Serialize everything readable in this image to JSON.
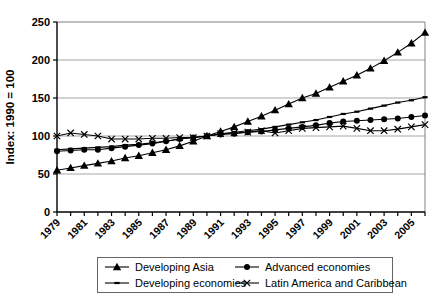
{
  "chart_data": {
    "type": "line",
    "title": "",
    "xlabel": "",
    "ylabel": "Index: 1990 = 100",
    "ylim": [
      0,
      250
    ],
    "y_ticks": [
      0,
      50,
      100,
      150,
      200,
      250
    ],
    "grid": "horizontal gridlines at 50,100,150,200",
    "legend_position": "bottom",
    "x": [
      1979,
      1980,
      1981,
      1982,
      1983,
      1984,
      1985,
      1986,
      1987,
      1988,
      1989,
      1990,
      1991,
      1992,
      1993,
      1994,
      1995,
      1996,
      1997,
      1998,
      1999,
      2000,
      2001,
      2002,
      2003,
      2004,
      2005,
      2006
    ],
    "x_tick_labels": [
      "1979",
      "1981",
      "1983",
      "1985",
      "1987",
      "1989",
      "1991",
      "1993",
      "1995",
      "1997",
      "1999",
      "2001",
      "2003",
      "2005"
    ],
    "series": [
      {
        "name": "Developing Asia",
        "marker": "triangle",
        "color": "#000000",
        "values": [
          55,
          58,
          61,
          64,
          67,
          71,
          74,
          78,
          82,
          87,
          93,
          100,
          106,
          112,
          119,
          126,
          134,
          142,
          150,
          156,
          164,
          172,
          180,
          189,
          199,
          210,
          222,
          236
        ]
      },
      {
        "name": "Advanced economies",
        "marker": "circle",
        "color": "#000000",
        "values": [
          80,
          81,
          82,
          82,
          84,
          86,
          88,
          90,
          93,
          96,
          98,
          100,
          102,
          103,
          105,
          106,
          108,
          110,
          112,
          114,
          117,
          119,
          120,
          121,
          122,
          123,
          125,
          127
        ]
      },
      {
        "name": "Developing economies",
        "marker": "dash",
        "color": "#000000",
        "values": [
          82,
          83,
          84,
          85,
          86,
          88,
          89,
          91,
          93,
          96,
          98,
          100,
          103,
          105,
          107,
          109,
          112,
          115,
          118,
          121,
          125,
          129,
          132,
          136,
          140,
          144,
          147,
          151
        ]
      },
      {
        "name": "Latin America and Caribbean",
        "marker": "x",
        "color": "#000000",
        "values": [
          100,
          104,
          102,
          100,
          96,
          96,
          96,
          97,
          97,
          98,
          98,
          100,
          103,
          104,
          105,
          107,
          104,
          107,
          110,
          111,
          112,
          113,
          110,
          107,
          107,
          109,
          112,
          115
        ]
      }
    ],
    "colors": {
      "line": "#000000",
      "gridline": "#a6a6a6",
      "plot_border": "#808080",
      "axis": "#000000"
    }
  }
}
